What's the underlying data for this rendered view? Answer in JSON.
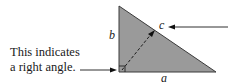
{
  "labels": {
    "side_a": "a",
    "side_b": "b",
    "side_c": "c",
    "note_line1": "This indicates",
    "note_line2": "a right angle."
  },
  "colors": {
    "triangle_fill": "#9a9a9a",
    "stroke": "#2a2a2a"
  }
}
